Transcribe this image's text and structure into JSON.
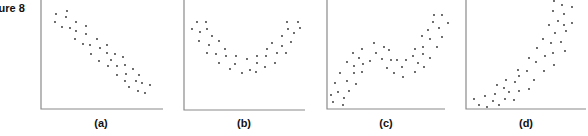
{
  "figure": {
    "title": "Figure 8",
    "visible_title": "ure 8"
  },
  "colors": {
    "axis": "#8a8a8a",
    "dot": "#2b2b2b",
    "background": "#ffffff"
  },
  "chart_data": [
    {
      "type": "scatter",
      "title": "(a)",
      "description": "Strong negative linear relationship",
      "xlabel": "",
      "ylabel": "",
      "grid": false,
      "axis": {
        "left": 41,
        "bottom": 109,
        "right": 163
      },
      "points_px": [
        [
          56,
          14
        ],
        [
          67,
          11
        ],
        [
          55,
          22
        ],
        [
          66,
          17
        ],
        [
          62,
          27
        ],
        [
          70,
          28
        ],
        [
          76,
          22
        ],
        [
          76,
          31
        ],
        [
          86,
          26
        ],
        [
          86,
          34
        ],
        [
          75,
          39
        ],
        [
          83,
          44
        ],
        [
          97,
          39
        ],
        [
          90,
          45
        ],
        [
          107,
          45
        ],
        [
          100,
          48
        ],
        [
          107,
          53
        ],
        [
          91,
          54
        ],
        [
          115,
          54
        ],
        [
          123,
          57
        ],
        [
          111,
          60
        ],
        [
          99,
          61
        ],
        [
          108,
          66
        ],
        [
          117,
          66
        ],
        [
          125,
          65
        ],
        [
          133,
          69
        ],
        [
          126,
          74
        ],
        [
          117,
          75
        ],
        [
          139,
          75
        ],
        [
          125,
          81
        ],
        [
          136,
          81
        ],
        [
          142,
          83
        ],
        [
          129,
          87
        ],
        [
          150,
          85
        ],
        [
          138,
          91
        ],
        [
          145,
          93
        ]
      ]
    },
    {
      "type": "scatter",
      "title": "(b)",
      "description": "U-shaped (quadratic) relationship",
      "xlabel": "",
      "ylabel": "",
      "grid": false,
      "axis": {
        "left": 184,
        "bottom": 110,
        "right": 305
      },
      "points_px": [
        [
          192,
          29
        ],
        [
          197,
          22
        ],
        [
          206,
          22
        ],
        [
          200,
          32
        ],
        [
          207,
          29
        ],
        [
          212,
          36
        ],
        [
          199,
          41
        ],
        [
          209,
          45
        ],
        [
          219,
          41
        ],
        [
          207,
          53
        ],
        [
          216,
          54
        ],
        [
          225,
          49
        ],
        [
          226,
          56
        ],
        [
          219,
          63
        ],
        [
          236,
          56
        ],
        [
          235,
          64
        ],
        [
          230,
          69
        ],
        [
          247,
          59
        ],
        [
          242,
          73
        ],
        [
          250,
          70
        ],
        [
          257,
          56
        ],
        [
          257,
          63
        ],
        [
          256,
          72
        ],
        [
          265,
          67
        ],
        [
          266,
          56
        ],
        [
          267,
          49
        ],
        [
          272,
          43
        ],
        [
          277,
          53
        ],
        [
          275,
          63
        ],
        [
          282,
          46
        ],
        [
          286,
          53
        ],
        [
          282,
          36
        ],
        [
          291,
          42
        ],
        [
          288,
          29
        ],
        [
          287,
          22
        ],
        [
          298,
          22
        ],
        [
          294,
          33
        ],
        [
          300,
          28
        ]
      ]
    },
    {
      "type": "scatter",
      "title": "(c)",
      "description": "Cubic-like (rise, plateau, rise) relationship",
      "xlabel": "",
      "ylabel": "",
      "grid": false,
      "axis": {
        "left": 327,
        "bottom": 109,
        "right": 445
      },
      "points_px": [
        [
          331,
          95
        ],
        [
          333,
          102
        ],
        [
          335,
          83
        ],
        [
          338,
          92
        ],
        [
          340,
          73
        ],
        [
          344,
          98
        ],
        [
          343,
          105
        ],
        [
          347,
          81
        ],
        [
          347,
          62
        ],
        [
          349,
          91
        ],
        [
          353,
          53
        ],
        [
          354,
          73
        ],
        [
          354,
          66
        ],
        [
          356,
          84
        ],
        [
          359,
          58
        ],
        [
          362,
          49
        ],
        [
          362,
          72
        ],
        [
          363,
          64
        ],
        [
          370,
          61
        ],
        [
          374,
          43
        ],
        [
          376,
          53
        ],
        [
          382,
          59
        ],
        [
          384,
          47
        ],
        [
          387,
          68
        ],
        [
          389,
          50
        ],
        [
          391,
          60
        ],
        [
          394,
          73
        ],
        [
          397,
          60
        ],
        [
          402,
          67
        ],
        [
          403,
          77
        ],
        [
          406,
          60
        ],
        [
          413,
          56
        ],
        [
          415,
          72
        ],
        [
          415,
          49
        ],
        [
          418,
          63
        ],
        [
          422,
          36
        ],
        [
          423,
          54
        ],
        [
          423,
          47
        ],
        [
          424,
          67
        ],
        [
          428,
          30
        ],
        [
          430,
          58
        ],
        [
          430,
          39
        ],
        [
          433,
          22
        ],
        [
          434,
          15
        ],
        [
          437,
          47
        ],
        [
          439,
          28
        ],
        [
          442,
          37
        ],
        [
          442,
          15
        ],
        [
          448,
          23
        ]
      ]
    },
    {
      "type": "scatter",
      "title": "(d)",
      "description": "Positive curvilinear (exponential-like) relationship",
      "xlabel": "",
      "ylabel": "",
      "grid": false,
      "axis": {
        "left": 466,
        "bottom": 109,
        "right": 586
      },
      "points_px": [
        [
          474,
          99
        ],
        [
          479,
          105
        ],
        [
          485,
          96
        ],
        [
          487,
          107
        ],
        [
          493,
          101
        ],
        [
          495,
          94
        ],
        [
          497,
          85
        ],
        [
          499,
          105
        ],
        [
          504,
          88
        ],
        [
          505,
          99
        ],
        [
          506,
          80
        ],
        [
          509,
          92
        ],
        [
          514,
          100
        ],
        [
          515,
          82
        ],
        [
          518,
          70
        ],
        [
          519,
          91
        ],
        [
          519,
          76
        ],
        [
          527,
          71
        ],
        [
          529,
          58
        ],
        [
          529,
          89
        ],
        [
          534,
          80
        ],
        [
          536,
          62
        ],
        [
          537,
          48
        ],
        [
          543,
          39
        ],
        [
          544,
          71
        ],
        [
          545,
          56
        ],
        [
          549,
          25
        ],
        [
          551,
          43
        ],
        [
          553,
          53
        ],
        [
          554,
          65
        ],
        [
          555,
          33
        ],
        [
          553,
          11
        ],
        [
          554,
          1
        ],
        [
          558,
          21
        ],
        [
          561,
          42
        ],
        [
          562,
          5
        ],
        [
          564,
          14
        ],
        [
          564,
          25
        ],
        [
          565,
          51
        ],
        [
          566,
          31
        ],
        [
          572,
          7
        ],
        [
          572,
          23
        ]
      ]
    }
  ]
}
